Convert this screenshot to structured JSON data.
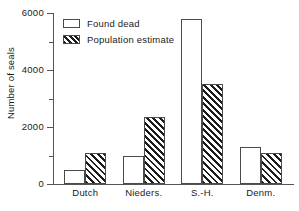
{
  "chart_data": {
    "type": "bar",
    "title": "",
    "xlabel": "",
    "ylabel": "Number of seals",
    "categories": [
      "Dutch",
      "Nieders.",
      "S.-H.",
      "Denm."
    ],
    "series": [
      {
        "name": "Found dead",
        "values": [
          500,
          1000,
          5800,
          1300
        ],
        "style": "open"
      },
      {
        "name": "Population estimate",
        "values": [
          1100,
          2350,
          3500,
          1100
        ],
        "style": "hatched"
      }
    ],
    "ylim": [
      0,
      6000
    ],
    "yticks": [
      0,
      2000,
      4000,
      6000
    ],
    "ytick_labels": [
      "0",
      "2000",
      "4000",
      "6000"
    ],
    "yminor_ticks": [
      1000,
      3000,
      5000
    ],
    "grid": false,
    "legend_position": "top-left",
    "legend_entries": [
      "Found dead",
      "Population estimate"
    ],
    "axis_color": "#555555",
    "bar_edge_color": "#4a4a4a",
    "hatch_color": "#1c1c1c",
    "background": "#ffffff"
  }
}
